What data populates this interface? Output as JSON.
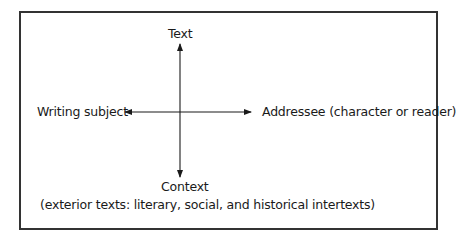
{
  "diagram": {
    "top_label": "Text",
    "left_label": "Writing subject",
    "right_label": "Addressee (character or reader)",
    "bottom_label": "Context",
    "bottom_sublabel": "(exterior texts: literary, social, and historical intertexts)"
  },
  "colors": {
    "line": "#1a1a1a",
    "border": "#333333",
    "background": "#ffffff"
  }
}
